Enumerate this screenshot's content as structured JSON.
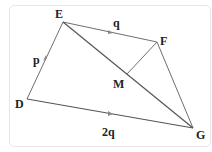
{
  "diagram": {
    "points": {
      "E": {
        "label": "E",
        "x": 63,
        "y": 22
      },
      "F": {
        "label": "F",
        "x": 157,
        "y": 42
      },
      "M": {
        "label": "M",
        "x": 127,
        "y": 74
      },
      "D": {
        "label": "D",
        "x": 27,
        "y": 99
      },
      "G": {
        "label": "G",
        "x": 193,
        "y": 128
      }
    },
    "vectors": {
      "DE": {
        "label": "p"
      },
      "EF": {
        "label": "q"
      },
      "DG": {
        "label": "2q"
      }
    },
    "segments": [
      "DE",
      "EF",
      "EG",
      "FM",
      "FG",
      "DG"
    ]
  }
}
